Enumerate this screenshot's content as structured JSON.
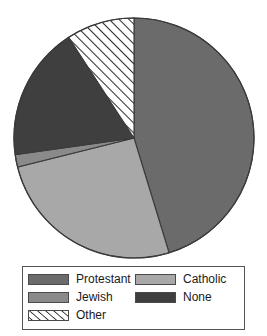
{
  "chart_data": {
    "type": "pie",
    "title": "",
    "subtitle": "",
    "xlabel": "",
    "ylabel": "",
    "grid": false,
    "legend_position": "bottom",
    "start_angle_deg": 0,
    "direction": "clockwise",
    "categories": [
      "Protestant",
      "Catholic",
      "Jewish",
      "None",
      "Other"
    ],
    "values": [
      45,
      26,
      2,
      18,
      9
    ],
    "units": "percent",
    "slices": [
      {
        "label": "Protestant",
        "value": 45,
        "start_deg": 0,
        "end_deg": 163,
        "color": "#6b6b6b",
        "pattern": "solid"
      },
      {
        "label": "Catholic",
        "value": 26,
        "start_deg": 163,
        "end_deg": 256,
        "color": "#a8a8a8",
        "pattern": "solid"
      },
      {
        "label": "Jewish",
        "value": 2,
        "start_deg": 256,
        "end_deg": 262,
        "color": "#8a8a8a",
        "pattern": "solid"
      },
      {
        "label": "None",
        "value": 18,
        "start_deg": 262,
        "end_deg": 327,
        "color": "#3f3f3f",
        "pattern": "solid"
      },
      {
        "label": "Other",
        "value": 9,
        "start_deg": 327,
        "end_deg": 360,
        "color": "#ffffff",
        "pattern": "diagonal-hatch"
      }
    ],
    "geometry": {
      "center_x": 134,
      "center_y": 138,
      "radius": 120,
      "outline_color": "#3a3a3a"
    }
  },
  "legend": {
    "border_color": "#555555",
    "entries": [
      {
        "label": "Protestant",
        "swatch": "protestant-swatch",
        "color": "#6b6b6b",
        "pattern": "solid"
      },
      {
        "label": "Catholic",
        "swatch": "catholic-swatch",
        "color": "#a8a8a8",
        "pattern": "solid"
      },
      {
        "label": "Jewish",
        "swatch": "jewish-swatch",
        "color": "#8a8a8a",
        "pattern": "solid"
      },
      {
        "label": "None",
        "swatch": "none-swatch",
        "color": "#3f3f3f",
        "pattern": "solid"
      },
      {
        "label": "Other",
        "swatch": "other-swatch",
        "color": "#ffffff",
        "pattern": "diagonal-hatch"
      }
    ]
  }
}
